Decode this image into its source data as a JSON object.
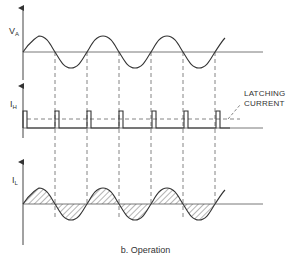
{
  "figure": {
    "caption": "b. Operation",
    "annotation": {
      "line1": "LATCHING",
      "line2": "CURRENT"
    },
    "panels": [
      {
        "id": "anode-voltage",
        "label_main": "V",
        "label_sub": "A",
        "waveform": "sine"
      },
      {
        "id": "gate-current",
        "label_main": "I",
        "label_sub": "H",
        "waveform": "pulse-train"
      },
      {
        "id": "load-current",
        "label_main": "I",
        "label_sub": "L",
        "waveform": "sine-hatched"
      }
    ]
  },
  "colors": {
    "stroke": "#333333",
    "axis": "#555555",
    "dash": "#666666",
    "background": "#ffffff"
  }
}
